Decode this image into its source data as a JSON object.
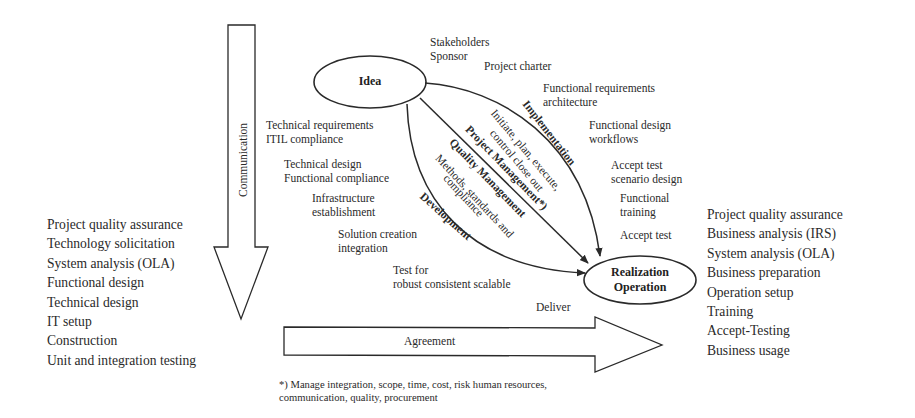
{
  "nodes": {
    "idea": "Idea",
    "realization_line1": "Realization",
    "realization_line2": "Operation"
  },
  "arrows": {
    "communication": "Communication",
    "agreement": "Agreement"
  },
  "left_list": [
    "Project quality assurance",
    "Technology solicitation",
    "System analysis (OLA)",
    "Functional design",
    "Technical design",
    "IT setup",
    "Construction",
    "Unit and integration testing"
  ],
  "right_list": [
    "Project quality assurance",
    "Business analysis (IRS)",
    "System analysis (OLA)",
    "Business preparation",
    "Operation setup",
    "Training",
    "Accept-Testing",
    "Business usage"
  ],
  "top_labels": {
    "stakeholders": "Stakeholders",
    "sponsor": "Sponsor",
    "project_charter": "Project charter",
    "func_req_1": "Functional requirements",
    "func_req_2": "architecture",
    "func_design_1": "Functional design",
    "func_design_2": "workflows",
    "accept_test_design_1": "Accept test",
    "accept_test_design_2": "scenario design",
    "func_training_1": "Functional",
    "func_training_2": "training",
    "accept_test": "Accept test"
  },
  "left_labels": {
    "tech_req_1": "Technical requirements",
    "tech_req_2": "ITIL compliance",
    "tech_design_1": "Technical design",
    "tech_design_2": "Functional compliance",
    "infra_1": "Infrastructure",
    "infra_2": "establishment",
    "solution_1": "Solution creation",
    "solution_2": "integration",
    "test_1": "Test for",
    "test_2": "robust consistent scalable",
    "deliver": "Deliver"
  },
  "curve_labels": {
    "implementation": "Implementation",
    "initiate_1": "Initiate, plan, execute,",
    "initiate_2": "control close out",
    "project_management": "Project Management*)",
    "quality_management": "Quality Management",
    "methods_1": "Methods, standards and",
    "methods_2": "compliance",
    "development": "Development"
  },
  "footnote": {
    "line1": "*) Manage integration, scope, time, cost, risk human resources,",
    "line2": "communication, quality, procurement"
  },
  "colors": {
    "stroke": "#2a2a2a",
    "background": "#ffffff"
  }
}
